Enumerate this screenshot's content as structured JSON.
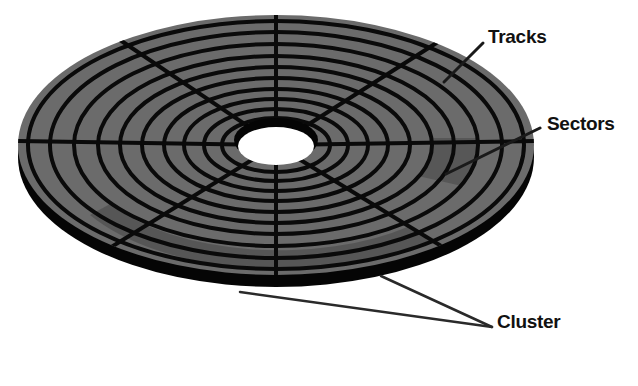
{
  "diagram": {
    "labels": {
      "tracks": "Tracks",
      "sectors": "Sectors",
      "cluster": "Cluster"
    },
    "colors": {
      "platter": "#6b6b6b",
      "lines": "#0a0a0a",
      "rim": "#050505",
      "highlight_region": "#555555",
      "hole": "#ffffff",
      "background": "#ffffff"
    },
    "geometry": {
      "center_x": 276,
      "center_y": 145,
      "outer_rx": 258,
      "outer_ry": 130,
      "hole_rx": 40,
      "hole_ry": 20,
      "rim_thickness": 12,
      "track_count": 9,
      "sector_spokes": 8
    }
  }
}
